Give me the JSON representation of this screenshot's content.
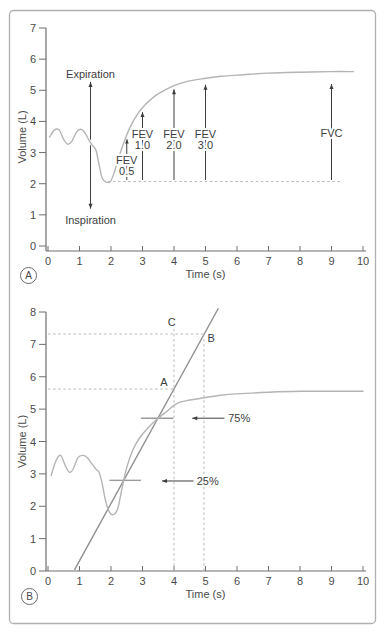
{
  "colors": {
    "frame": "#b0b0b0",
    "axis": "#6e6e6e",
    "curve": "#b4b4b4",
    "fef_line": "#909090",
    "annotation": "#3d3d3d",
    "dashed": "#b8b8b8",
    "segment": "#9a9a9a",
    "background": "#ffffff"
  },
  "chart_data": [
    {
      "panel": "A",
      "type": "line",
      "xlabel": "Time (s)",
      "ylabel": "Volume (L)",
      "xlim": [
        0,
        10
      ],
      "ylim": [
        0,
        7
      ],
      "xticks": [
        0,
        1,
        2,
        3,
        4,
        5,
        6,
        7,
        8,
        9,
        10
      ],
      "yticks": [
        0,
        1,
        2,
        3,
        4,
        5,
        6,
        7
      ],
      "grid": false,
      "series": [
        {
          "name": "spirogram",
          "kind": "spline",
          "color": "#b4b4b4",
          "points": [
            [
              0.05,
              3.5
            ],
            [
              0.2,
              3.72
            ],
            [
              0.35,
              3.73
            ],
            [
              0.5,
              3.42
            ],
            [
              0.62,
              3.27
            ],
            [
              0.75,
              3.35
            ],
            [
              0.9,
              3.65
            ],
            [
              1.02,
              3.75
            ],
            [
              1.15,
              3.67
            ],
            [
              1.3,
              3.4
            ],
            [
              1.42,
              3.22
            ],
            [
              1.52,
              3.08
            ],
            [
              1.62,
              2.62
            ],
            [
              1.72,
              2.18
            ],
            [
              1.85,
              2.05
            ],
            [
              1.98,
              2.07
            ],
            [
              2.1,
              2.35
            ],
            [
              2.25,
              2.85
            ],
            [
              2.4,
              3.3
            ],
            [
              2.6,
              3.8
            ],
            [
              2.85,
              4.25
            ],
            [
              3.1,
              4.55
            ],
            [
              3.4,
              4.82
            ],
            [
              3.7,
              5.0
            ],
            [
              4.0,
              5.15
            ],
            [
              4.4,
              5.28
            ],
            [
              4.9,
              5.37
            ],
            [
              5.5,
              5.45
            ],
            [
              6.2,
              5.5
            ],
            [
              7.0,
              5.55
            ],
            [
              8.0,
              5.58
            ],
            [
              9.0,
              5.6
            ],
            [
              9.7,
              5.6
            ]
          ]
        }
      ],
      "annotations": {
        "arrows": [
          {
            "x1": 1.35,
            "y1": 1.2,
            "x2": 1.35,
            "y2": 5.27,
            "heads": "both"
          },
          {
            "x1": 2.5,
            "y1": 2.12,
            "x2": 2.5,
            "y2": 3.45,
            "heads": "end"
          },
          {
            "x1": 3.0,
            "y1": 2.12,
            "x2": 3.0,
            "y2": 4.3,
            "heads": "end"
          },
          {
            "x1": 4.0,
            "y1": 2.12,
            "x2": 4.0,
            "y2": 5.03,
            "heads": "end"
          },
          {
            "x1": 5.0,
            "y1": 2.12,
            "x2": 5.0,
            "y2": 5.18,
            "heads": "end"
          },
          {
            "x1": 9.0,
            "y1": 2.12,
            "x2": 9.0,
            "y2": 5.2,
            "heads": "end"
          }
        ],
        "dashed_lines": [
          {
            "x1": 1.9,
            "y1": 2.07,
            "x2": 9.35,
            "y2": 2.07
          }
        ],
        "solid_segments": [],
        "labels": [
          {
            "x": 1.35,
            "y": 5.52,
            "text": "Expiration"
          },
          {
            "x": 1.35,
            "y": 0.85,
            "text": "Inspiration"
          },
          {
            "x": 2.5,
            "y": 2.75,
            "text": "FEV"
          },
          {
            "x": 2.5,
            "y": 2.4,
            "text": "0.5"
          },
          {
            "x": 3.0,
            "y": 3.6,
            "text": "FEV"
          },
          {
            "x": 3.0,
            "y": 3.25,
            "text": "1.0"
          },
          {
            "x": 4.0,
            "y": 3.6,
            "text": "FEV"
          },
          {
            "x": 4.0,
            "y": 3.25,
            "text": "2.0"
          },
          {
            "x": 5.0,
            "y": 3.6,
            "text": "FEV"
          },
          {
            "x": 5.0,
            "y": 3.25,
            "text": "3.0"
          },
          {
            "x": 9.0,
            "y": 3.62,
            "text": "FVC"
          }
        ]
      }
    },
    {
      "panel": "B",
      "type": "line",
      "xlabel": "Time (s)",
      "ylabel": "Volume (L)",
      "xlim": [
        0,
        10
      ],
      "ylim": [
        0,
        8
      ],
      "xticks": [
        0,
        1,
        2,
        3,
        4,
        5,
        6,
        7,
        8,
        9,
        10
      ],
      "yticks": [
        0,
        1,
        2,
        3,
        4,
        5,
        6,
        7,
        8
      ],
      "grid": false,
      "series": [
        {
          "name": "fef25-75-line",
          "kind": "line",
          "color": "#909090",
          "points": [
            [
              0.85,
              0.05
            ],
            [
              5.4,
              8.1
            ]
          ]
        },
        {
          "name": "spirogram",
          "kind": "spline",
          "color": "#b4b4b4",
          "points": [
            [
              0.1,
              2.95
            ],
            [
              0.25,
              3.4
            ],
            [
              0.4,
              3.57
            ],
            [
              0.55,
              3.25
            ],
            [
              0.68,
              3.05
            ],
            [
              0.8,
              3.15
            ],
            [
              0.95,
              3.5
            ],
            [
              1.1,
              3.57
            ],
            [
              1.25,
              3.5
            ],
            [
              1.4,
              3.3
            ],
            [
              1.52,
              3.15
            ],
            [
              1.62,
              3.05
            ],
            [
              1.72,
              2.7
            ],
            [
              1.82,
              2.2
            ],
            [
              1.95,
              1.82
            ],
            [
              2.1,
              1.75
            ],
            [
              2.22,
              1.95
            ],
            [
              2.35,
              2.55
            ],
            [
              2.5,
              3.2
            ],
            [
              2.7,
              3.75
            ],
            [
              2.9,
              4.1
            ],
            [
              3.2,
              4.45
            ],
            [
              3.5,
              4.72
            ],
            [
              3.8,
              4.95
            ],
            [
              4.1,
              5.18
            ],
            [
              4.5,
              5.28
            ],
            [
              5.0,
              5.36
            ],
            [
              5.5,
              5.43
            ],
            [
              6.0,
              5.47
            ],
            [
              7.0,
              5.52
            ],
            [
              8.0,
              5.55
            ],
            [
              9.0,
              5.55
            ],
            [
              10.0,
              5.55
            ]
          ]
        }
      ],
      "annotations": {
        "arrows": [
          {
            "x1": 4.62,
            "y1": 2.78,
            "x2": 3.62,
            "y2": 2.78,
            "heads": "end"
          },
          {
            "x1": 5.6,
            "y1": 4.72,
            "x2": 4.58,
            "y2": 4.72,
            "heads": "end"
          }
        ],
        "dashed_lines": [
          {
            "x1": 0,
            "y1": 7.32,
            "x2": 4.95,
            "y2": 7.32
          },
          {
            "x1": 0,
            "y1": 5.62,
            "x2": 4.0,
            "y2": 5.62
          },
          {
            "x1": 4.0,
            "y1": 0,
            "x2": 4.0,
            "y2": 7.5
          },
          {
            "x1": 4.95,
            "y1": 0,
            "x2": 4.95,
            "y2": 7.32
          }
        ],
        "solid_segments": [
          {
            "x1": 1.95,
            "y1": 2.8,
            "x2": 2.95,
            "y2": 2.8
          },
          {
            "x1": 2.95,
            "y1": 4.72,
            "x2": 3.98,
            "y2": 4.72
          }
        ],
        "labels": [
          {
            "x": 3.93,
            "y": 7.68,
            "text": "C"
          },
          {
            "x": 5.18,
            "y": 7.2,
            "text": "B"
          },
          {
            "x": 3.68,
            "y": 5.85,
            "text": "A"
          },
          {
            "x": 4.72,
            "y": 2.78,
            "text": "25%",
            "anchor": "start"
          },
          {
            "x": 5.72,
            "y": 4.72,
            "text": "75%",
            "anchor": "start"
          }
        ]
      }
    }
  ]
}
